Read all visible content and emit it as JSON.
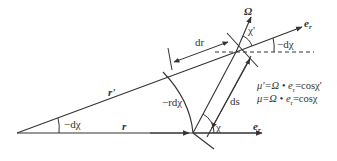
{
  "diagram": {
    "labels": {
      "r_prime": "r'",
      "r": "r",
      "neg_dchi_left": "−dχ",
      "neg_dchi_right": "−dχ",
      "neg_r_dchi": "−rdχ",
      "dr": "dr",
      "ds": "ds",
      "chi": "χ",
      "chi_prime": "χ'",
      "omega": "Ω",
      "e_r_top": "e",
      "e_r_top_sub": "r",
      "e_r_bottom": "e",
      "e_r_bottom_sub": "r"
    },
    "formulas": [
      {
        "text": "μ'=Ω • e",
        "sub": "r",
        "tail": "=cosχ'"
      },
      {
        "text": "μ=Ω • e",
        "sub": "r",
        "tail": "=cosχ"
      }
    ],
    "colors": {
      "line": "#333333",
      "background": "#ffffff"
    }
  }
}
